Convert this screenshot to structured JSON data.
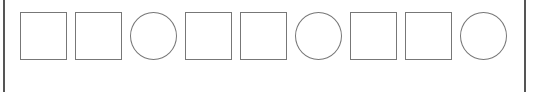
{
  "panel": {
    "border_color": "#555555",
    "shapes": [
      {
        "type": "square"
      },
      {
        "type": "square"
      },
      {
        "type": "circle"
      },
      {
        "type": "square"
      },
      {
        "type": "square"
      },
      {
        "type": "circle"
      },
      {
        "type": "square"
      },
      {
        "type": "square"
      },
      {
        "type": "circle"
      }
    ],
    "shape_stroke": "#777777"
  }
}
